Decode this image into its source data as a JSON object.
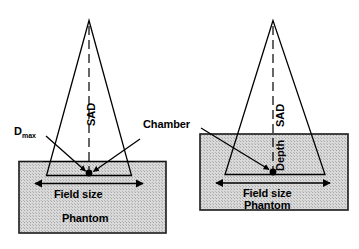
{
  "figure": {
    "background_color": "#ffffff",
    "line_color": "#000000",
    "phantom_fill_color": "#d4d4d4"
  },
  "panels": [
    {
      "id": "left",
      "name": "ssd-setup",
      "labels": {
        "dmax_main": "D",
        "dmax_sub": "max",
        "sad": "SAD",
        "field_size": "Field size",
        "phantom": "Phantom"
      }
    },
    {
      "id": "right",
      "name": "sad-setup",
      "labels": {
        "sad": "SAD",
        "depth": "Depth",
        "field_size": "Field size",
        "phantom": "Phantom"
      }
    }
  ],
  "shared": {
    "chamber": "Chamber"
  }
}
